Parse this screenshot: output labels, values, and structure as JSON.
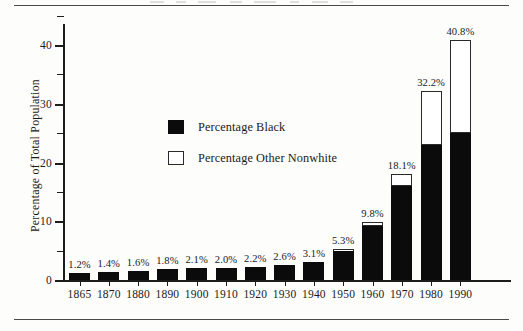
{
  "chart_data": {
    "type": "bar",
    "stacked": true,
    "title": "",
    "xlabel": "",
    "ylabel": "Percentage of Total Population",
    "ylim": [
      0,
      45
    ],
    "yticks_major": [
      0,
      10,
      20,
      30,
      40
    ],
    "yticks_minor": [
      5,
      15,
      25,
      35,
      45
    ],
    "grid": false,
    "legend_position": "inside-upper-center",
    "categories": [
      "1865",
      "1870",
      "1880",
      "1890",
      "1900",
      "1910",
      "1920",
      "1930",
      "1940",
      "1950",
      "1960",
      "1970",
      "1980",
      "1990"
    ],
    "series": [
      {
        "name": "Percentage Black",
        "color": "#0b0b0b",
        "values": [
          1.2,
          1.4,
          1.6,
          1.8,
          2.1,
          2.0,
          2.2,
          2.6,
          3.1,
          5.0,
          9.2,
          16.0,
          23.0,
          25.0
        ]
      },
      {
        "name": "Percentage Other Nonwhite",
        "color": "#ffffff",
        "values": [
          0.0,
          0.0,
          0.0,
          0.0,
          0.0,
          0.0,
          0.0,
          0.0,
          0.0,
          0.3,
          0.6,
          2.1,
          9.2,
          15.8
        ]
      }
    ],
    "totals": [
      1.2,
      1.4,
      1.6,
      1.8,
      2.1,
      2.0,
      2.2,
      2.6,
      3.1,
      5.3,
      9.8,
      18.1,
      32.2,
      40.8
    ],
    "data_labels": [
      "1.2%",
      "1.4%",
      "1.6%",
      "1.8%",
      "2.1%",
      "2.0%",
      "2.2%",
      "2.6%",
      "3.1%",
      "5.3%",
      "9.8%",
      "18.1%",
      "32.2%",
      "40.8%"
    ]
  },
  "yaxis": {
    "title": "Percentage of Total Population",
    "tick_labels": [
      "40",
      "30",
      "20",
      "10",
      "0"
    ]
  },
  "legend": {
    "items": [
      {
        "label": "Percentage Black",
        "swatch": "filled-square"
      },
      {
        "label": "Percentage Other Nonwhite",
        "swatch": "hollow-square"
      }
    ]
  }
}
